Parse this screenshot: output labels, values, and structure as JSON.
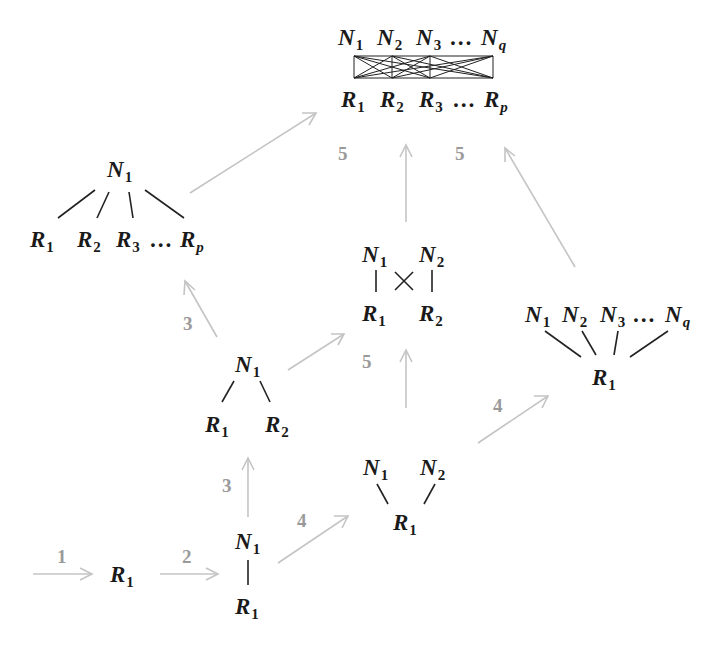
{
  "diagram": {
    "colors": {
      "node_text": "#1a1a1a",
      "edge": "#222222",
      "arrow": "#c4c4c4",
      "step_label": "#9a9a9a"
    },
    "nodes": [
      {
        "id": "single-R",
        "labels": [
          {
            "text": "R",
            "sub": "1",
            "x": 110,
            "y": 582
          }
        ]
      },
      {
        "id": "N1-R1",
        "labels": [
          {
            "text": "N",
            "sub": "1",
            "x": 235,
            "y": 549
          },
          {
            "text": "R",
            "sub": "1",
            "x": 235,
            "y": 614
          }
        ]
      },
      {
        "id": "N1-R1R2",
        "labels": [
          {
            "text": "N",
            "sub": "1",
            "x": 235,
            "y": 372
          },
          {
            "text": "R",
            "sub": "1",
            "x": 205,
            "y": 432
          },
          {
            "text": "R",
            "sub": "2",
            "x": 265,
            "y": 432
          }
        ]
      },
      {
        "id": "N1N2-R1",
        "labels": [
          {
            "text": "N",
            "sub": "1",
            "x": 363,
            "y": 475
          },
          {
            "text": "N",
            "sub": "2",
            "x": 420,
            "y": 475
          },
          {
            "text": "R",
            "sub": "1",
            "x": 393,
            "y": 530
          }
        ]
      },
      {
        "id": "N1N2-R1R2-cross",
        "labels": [
          {
            "text": "N",
            "sub": "1",
            "x": 362,
            "y": 262
          },
          {
            "text": "N",
            "sub": "2",
            "x": 419,
            "y": 262
          },
          {
            "text": "R",
            "sub": "1",
            "x": 362,
            "y": 321
          },
          {
            "text": "R",
            "sub": "2",
            "x": 419,
            "y": 321
          }
        ]
      },
      {
        "id": "Nq-R1",
        "labels": [
          {
            "text": "N",
            "sub": "1",
            "x": 525,
            "y": 322
          },
          {
            "text": "N",
            "sub": "2",
            "x": 562,
            "y": 322
          },
          {
            "text": "N",
            "sub": "3",
            "x": 600,
            "y": 322
          },
          {
            "text": "…",
            "sub": "",
            "x": 633,
            "y": 322
          },
          {
            "text": "N",
            "sub": "q",
            "x": 665,
            "y": 322
          },
          {
            "text": "R",
            "sub": "1",
            "x": 592,
            "y": 385
          }
        ]
      },
      {
        "id": "N1-Rp",
        "labels": [
          {
            "text": "N",
            "sub": "1",
            "x": 107,
            "y": 177
          },
          {
            "text": "R",
            "sub": "1",
            "x": 30,
            "y": 247
          },
          {
            "text": "R",
            "sub": "2",
            "x": 77,
            "y": 247
          },
          {
            "text": "R",
            "sub": "3",
            "x": 116,
            "y": 247
          },
          {
            "text": "…",
            "sub": "",
            "x": 150,
            "y": 247
          },
          {
            "text": "R",
            "sub": "p",
            "x": 180,
            "y": 247
          }
        ]
      },
      {
        "id": "Nq-Rp-full",
        "labels": [
          {
            "text": "N",
            "sub": "1",
            "x": 338,
            "y": 45
          },
          {
            "text": "N",
            "sub": "2",
            "x": 377,
            "y": 45
          },
          {
            "text": "N",
            "sub": "3",
            "x": 416,
            "y": 45
          },
          {
            "text": "…",
            "sub": "",
            "x": 450,
            "y": 45
          },
          {
            "text": "N",
            "sub": "q",
            "x": 481,
            "y": 45
          },
          {
            "text": "R",
            "sub": "1",
            "x": 341,
            "y": 107
          },
          {
            "text": "R",
            "sub": "2",
            "x": 380,
            "y": 107
          },
          {
            "text": "R",
            "sub": "3",
            "x": 419,
            "y": 107
          },
          {
            "text": "…",
            "sub": "",
            "x": 453,
            "y": 107
          },
          {
            "text": "R",
            "sub": "p",
            "x": 484,
            "y": 107
          }
        ]
      }
    ],
    "steps": [
      {
        "label": "1",
        "x": 57,
        "y": 563
      },
      {
        "label": "2",
        "x": 182,
        "y": 563
      },
      {
        "label": "3",
        "x": 222,
        "y": 492
      },
      {
        "label": "4",
        "x": 297,
        "y": 527
      },
      {
        "label": "3",
        "x": 183,
        "y": 330
      },
      {
        "label": "5",
        "x": 362,
        "y": 368
      },
      {
        "label": "4",
        "x": 493,
        "y": 412
      },
      {
        "label": "5",
        "x": 338,
        "y": 160
      },
      {
        "label": "5",
        "x": 455,
        "y": 160
      }
    ]
  }
}
